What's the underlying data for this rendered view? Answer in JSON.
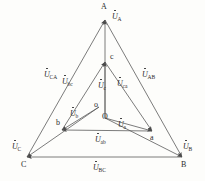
{
  "figure": {
    "type": "phasor-diagram",
    "title": ""
  },
  "colors": {
    "stroke": "#5a5a5a",
    "text": "#2b2b2b",
    "background": "#fdfdfb"
  },
  "points": [
    {
      "id": "A",
      "label": "A",
      "x": 105,
      "y": 20,
      "label_x": 101,
      "label_y": 3
    },
    {
      "id": "B",
      "label": "B",
      "x": 182,
      "y": 157,
      "label_x": 181,
      "label_y": 161
    },
    {
      "id": "C",
      "label": "C",
      "x": 27,
      "y": 157,
      "label_x": 21,
      "label_y": 161
    },
    {
      "id": "a",
      "label": "a",
      "x": 152,
      "y": 131,
      "label_x": 150,
      "label_y": 134
    },
    {
      "id": "b",
      "label": "b",
      "x": 62,
      "y": 130,
      "label_x": 56,
      "label_y": 119
    },
    {
      "id": "c",
      "label": "c",
      "x": 105,
      "y": 62,
      "label_x": 110,
      "label_y": 53
    },
    {
      "id": "o",
      "label": "o",
      "x": 99,
      "y": 107,
      "label_x": 94,
      "label_y": 101
    },
    {
      "id": "O",
      "label": "O",
      "x": 105,
      "y": 118,
      "label_x": 102,
      "label_y": 113
    }
  ],
  "phasors": [
    {
      "id": "UA",
      "base": "U",
      "sub": "A",
      "label_x": 112,
      "label_y": 13,
      "from": "O",
      "to": "A"
    },
    {
      "id": "UB",
      "base": "U",
      "sub": "B",
      "label_x": 183,
      "label_y": 143,
      "from": "O",
      "to": "B"
    },
    {
      "id": "UC",
      "base": "U",
      "sub": "C",
      "label_x": 12,
      "label_y": 143,
      "from": "O",
      "to": "C"
    },
    {
      "id": "UAB",
      "base": "U",
      "sub": "AB",
      "label_x": 142,
      "label_y": 71,
      "from": "A",
      "to": "B"
    },
    {
      "id": "UBC",
      "base": "U",
      "sub": "BC",
      "label_x": 93,
      "label_y": 164,
      "from": "B",
      "to": "C"
    },
    {
      "id": "UCA",
      "base": "U",
      "sub": "CA",
      "label_x": 44,
      "label_y": 71,
      "from": "C",
      "to": "A"
    },
    {
      "id": "Ua",
      "base": "U",
      "sub": "a",
      "label_x": 118,
      "label_y": 121,
      "from": "O",
      "to": "a"
    },
    {
      "id": "Ub",
      "base": "U",
      "sub": "b",
      "label_x": 70,
      "label_y": 110,
      "from": "O",
      "to": "b"
    },
    {
      "id": "Uc",
      "base": "U",
      "sub": "c",
      "label_x": 98,
      "label_y": 82,
      "from": "O",
      "to": "c"
    },
    {
      "id": "Uab",
      "base": "U",
      "sub": "ab",
      "label_x": 95,
      "label_y": 136,
      "from": "a",
      "to": "b"
    },
    {
      "id": "Ubc",
      "base": "U",
      "sub": "bc",
      "label_x": 62,
      "label_y": 78,
      "from": "b",
      "to": "c"
    },
    {
      "id": "Uca",
      "base": "U",
      "sub": "ca",
      "label_x": 117,
      "label_y": 80,
      "from": "c",
      "to": "a"
    }
  ],
  "segments": [
    {
      "id": "seg-CA",
      "name": "line-CA",
      "x1": 27,
      "y1": 157,
      "x2": 105,
      "y2": 20,
      "arrow": "end"
    },
    {
      "id": "seg-AB",
      "name": "line-AB",
      "x1": 105,
      "y1": 20,
      "x2": 182,
      "y2": 157,
      "arrow": "end"
    },
    {
      "id": "seg-BC",
      "name": "line-BC",
      "x1": 182,
      "y1": 157,
      "x2": 27,
      "y2": 157,
      "arrow": "end"
    },
    {
      "id": "seg-bc",
      "name": "line-bc",
      "x1": 62,
      "y1": 130,
      "x2": 105,
      "y2": 62,
      "arrow": "end"
    },
    {
      "id": "seg-ca",
      "name": "line-ca",
      "x1": 105,
      "y1": 62,
      "x2": 152,
      "y2": 131,
      "arrow": "end"
    },
    {
      "id": "seg-ab",
      "name": "line-ab",
      "x1": 152,
      "y1": 131,
      "x2": 62,
      "y2": 130,
      "arrow": "end"
    },
    {
      "id": "seg-OA",
      "name": "phasor-OA",
      "x1": 105,
      "y1": 118,
      "x2": 105,
      "y2": 20,
      "arrow": "end"
    },
    {
      "id": "seg-Oc",
      "name": "phasor-Oc",
      "x1": 105,
      "y1": 118,
      "x2": 105,
      "y2": 62,
      "arrow": "end"
    },
    {
      "id": "seg-Oa",
      "name": "phasor-Oa",
      "x1": 105,
      "y1": 118,
      "x2": 152,
      "y2": 131,
      "arrow": "end"
    },
    {
      "id": "seg-Ob",
      "name": "phasor-Ob",
      "x1": 99,
      "y1": 107,
      "x2": 62,
      "y2": 130,
      "arrow": "end"
    },
    {
      "id": "seg-OB",
      "name": "phasor-OB",
      "x1": 105,
      "y1": 118,
      "x2": 182,
      "y2": 157,
      "arrow": "end"
    },
    {
      "id": "seg-OC",
      "name": "phasor-OC",
      "x1": 99,
      "y1": 107,
      "x2": 27,
      "y2": 157,
      "arrow": "end"
    }
  ]
}
